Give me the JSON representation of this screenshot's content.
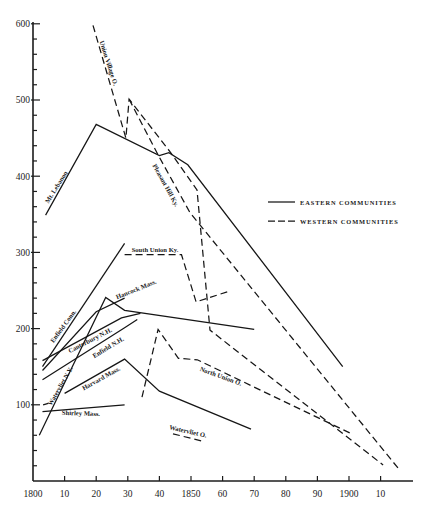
{
  "chart_data": {
    "type": "line",
    "title": "",
    "xlabel": "",
    "ylabel": "",
    "xlim": [
      1800,
      1920
    ],
    "ylim": [
      0,
      600
    ],
    "grid": false,
    "x_ticks": [
      1800,
      1810,
      1820,
      1830,
      1840,
      1850,
      1860,
      1870,
      1880,
      1890,
      1900,
      1910
    ],
    "x_tick_labels": [
      "1800",
      "10",
      "20",
      "30",
      "40",
      "1850",
      "60",
      "70",
      "80",
      "90",
      "1900",
      "10"
    ],
    "y_ticks": [
      100,
      200,
      300,
      400,
      500,
      600
    ],
    "y_tick_labels": [
      "100",
      "200",
      "300",
      "400",
      "500",
      "600"
    ],
    "y_minor_step": 20,
    "legend": {
      "position": "right-middle",
      "entries": [
        {
          "label": "EASTERN COMMUNITIES",
          "style": "solid"
        },
        {
          "label": "WESTERN COMMUNITIES",
          "style": "dashed"
        }
      ]
    },
    "series": [
      {
        "name": "Mt. Lebanon",
        "group": "eastern",
        "points": [
          [
            1804,
            349
          ],
          [
            1820,
            468
          ],
          [
            1840,
            427
          ],
          [
            1843,
            431
          ],
          [
            1849,
            415
          ],
          [
            1898,
            150
          ]
        ],
        "label_pos": {
          "x": 56,
          "y": 187,
          "rotate": -58
        }
      },
      {
        "name": "Enfield Conn.",
        "group": "eastern",
        "points": [
          [
            1803,
            150
          ],
          [
            1829,
            312
          ]
        ],
        "label_pos": {
          "x": 63,
          "y": 326,
          "rotate": -54
        }
      },
      {
        "name": "Hancock Mass.",
        "group": "eastern",
        "points": [
          [
            1803,
            145
          ],
          [
            1820,
            222
          ],
          [
            1829,
            240
          ]
        ],
        "label_pos": {
          "x": 136,
          "y": 289,
          "rotate": -22
        }
      },
      {
        "name": "Canterbury N.H.",
        "group": "eastern",
        "points": [
          [
            1803,
            158
          ],
          [
            1828,
            214
          ],
          [
            1834,
            220
          ]
        ],
        "label_pos": {
          "x": 90,
          "y": 340,
          "rotate": -27
        }
      },
      {
        "name": "Enfield N.H.",
        "group": "eastern",
        "points": [
          [
            1803,
            133
          ],
          [
            1829,
            201
          ],
          [
            1833,
            212
          ]
        ],
        "label_pos": {
          "x": 108,
          "y": 347,
          "rotate": -31
        }
      },
      {
        "name": "Watervliet N.Y.",
        "group": "eastern",
        "points": [
          [
            1802,
            60
          ],
          [
            1823,
            241
          ],
          [
            1829,
            224
          ],
          [
            1870,
            199
          ]
        ],
        "label_pos": {
          "x": 60,
          "y": 386,
          "rotate": -60
        }
      },
      {
        "name": "Harvard Mass.",
        "group": "eastern",
        "points": [
          [
            1810,
            115
          ],
          [
            1829,
            160
          ],
          [
            1840,
            118
          ],
          [
            1869,
            68
          ]
        ],
        "label_pos": {
          "x": 101,
          "y": 378,
          "rotate": -29
        }
      },
      {
        "name": "Shirley Mass.",
        "group": "eastern",
        "points": [
          [
            1803,
            91
          ],
          [
            1829,
            100
          ]
        ],
        "label_pos": {
          "x": 81,
          "y": 413,
          "rotate": 2
        }
      },
      {
        "name": "Union Village O.",
        "group": "western",
        "points": [
          [
            1819,
            598
          ],
          [
            1829.4,
            450
          ],
          [
            1830.4,
            501
          ],
          [
            1843.4,
            432
          ],
          [
            1851.9,
            382
          ],
          [
            1856,
            198
          ],
          [
            1910.8,
            21
          ]
        ],
        "label_pos": {
          "x": 109,
          "y": 63,
          "rotate": 72
        }
      },
      {
        "name": "Pleasant Hill Ky.",
        "group": "western",
        "points": [
          [
            1830.4,
            501
          ],
          [
            1839.6,
            428
          ],
          [
            1849.7,
            352
          ],
          [
            1915.5,
            17
          ]
        ],
        "label_pos": {
          "x": 166,
          "y": 185,
          "rotate": 61
        }
      },
      {
        "name": "South Union Ky.",
        "group": "western",
        "points": [
          [
            1829,
            297
          ],
          [
            1847,
            297
          ],
          [
            1851.6,
            235
          ],
          [
            1862,
            249
          ]
        ],
        "label_pos": {
          "x": 155,
          "y": 249,
          "rotate": 0
        }
      },
      {
        "name": "North Union O.",
        "group": "western",
        "points": [
          [
            1834.5,
            110
          ],
          [
            1839.6,
            199
          ],
          [
            1846,
            161
          ],
          [
            1852,
            159
          ],
          [
            1900.3,
            63
          ]
        ],
        "label_pos": {
          "x": 221,
          "y": 376,
          "rotate": 20
        }
      },
      {
        "name": "Watervliet O.",
        "group": "western",
        "points": [
          [
            1844.3,
            62
          ],
          [
            1853.8,
            52
          ]
        ],
        "label_pos": {
          "x": 188,
          "y": 431,
          "rotate": 13
        }
      },
      {
        "name": "",
        "group": "western",
        "points": [
          [
            1803.2,
            100
          ],
          [
            1804.8,
            102
          ]
        ],
        "label_pos": null
      }
    ]
  }
}
